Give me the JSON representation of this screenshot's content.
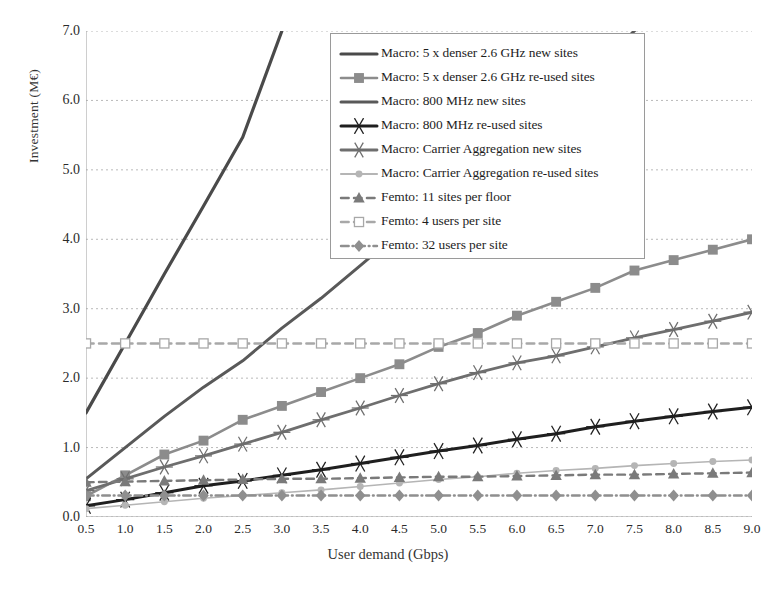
{
  "chart_data": {
    "type": "line",
    "title": "",
    "xlabel": "User demand (Gbps)",
    "ylabel": "Investment  (M€)",
    "xlim": [
      0.5,
      9.0
    ],
    "ylim": [
      0.0,
      7.0
    ],
    "grid": true,
    "legend_position": "top-center",
    "x": [
      0.5,
      1.0,
      1.5,
      2.0,
      2.5,
      3.0,
      3.5,
      4.0,
      4.5,
      5.0,
      5.5,
      6.0,
      6.5,
      7.0,
      7.5,
      8.0,
      8.5,
      9.0
    ],
    "xticks": [
      "0.5",
      "1.0",
      "1.5",
      "2.0",
      "2.5",
      "3.0",
      "3.5",
      "4.0",
      "4.5",
      "5.0",
      "5.5",
      "6.0",
      "6.5",
      "7.0",
      "7.5",
      "8.0",
      "8.5",
      "9.0"
    ],
    "yticks": [
      "0.0",
      "1.0",
      "2.0",
      "3.0",
      "4.0",
      "5.0",
      "6.0",
      "7.0"
    ],
    "series": [
      {
        "name": "Macro: 5 x denser 2.6 GHz new sites",
        "color": "#4a4a4a",
        "marker": "none",
        "dash": "solid",
        "width": 3.2,
        "values": [
          1.5,
          2.5,
          3.5,
          4.48,
          5.47,
          7.0,
          null,
          null,
          null,
          null,
          null,
          null,
          null,
          null,
          null,
          null,
          null,
          null
        ]
      },
      {
        "name": "Macro: 5 x denser 2.6 GHz re-used sites",
        "color": "#8c8c8c",
        "marker": "square",
        "dash": "solid",
        "width": 2.6,
        "values": [
          0.3,
          0.6,
          0.9,
          1.1,
          1.4,
          1.6,
          1.8,
          2.0,
          2.2,
          2.45,
          2.65,
          2.9,
          3.1,
          3.3,
          3.55,
          3.7,
          3.85,
          4.0
        ]
      },
      {
        "name": "Macro: 800 MHz new sites",
        "color": "#595959",
        "marker": "none",
        "dash": "solid",
        "width": 3.0,
        "values": [
          0.55,
          1.0,
          1.45,
          1.87,
          2.25,
          2.72,
          3.15,
          3.62,
          4.1,
          4.6,
          5.08,
          5.55,
          6.05,
          6.5,
          7.0,
          null,
          null,
          null
        ]
      },
      {
        "name": "Macro: 800 MHz re-used sites",
        "color": "#1f1f1f",
        "marker": "star",
        "dash": "solid",
        "width": 3.0,
        "values": [
          0.16,
          0.25,
          0.35,
          0.45,
          0.52,
          0.6,
          0.68,
          0.77,
          0.86,
          0.95,
          1.03,
          1.12,
          1.2,
          1.3,
          1.38,
          1.45,
          1.52,
          1.58
        ]
      },
      {
        "name": "Macro: Carrier Aggregation new sites",
        "color": "#6e6e6e",
        "marker": "star",
        "dash": "solid",
        "width": 2.8,
        "values": [
          0.38,
          0.55,
          0.72,
          0.88,
          1.05,
          1.22,
          1.4,
          1.57,
          1.75,
          1.92,
          2.08,
          2.22,
          2.32,
          2.45,
          2.58,
          2.7,
          2.82,
          2.95
        ]
      },
      {
        "name": "Macro: Carrier Aggregation re-used sites",
        "color": "#b5b5b5",
        "marker": "circle",
        "dash": "solid",
        "width": 1.6,
        "values": [
          0.12,
          0.17,
          0.22,
          0.27,
          0.31,
          0.35,
          0.39,
          0.44,
          0.49,
          0.54,
          0.58,
          0.63,
          0.67,
          0.7,
          0.74,
          0.77,
          0.8,
          0.82
        ]
      },
      {
        "name": "Femto: 11 sites per floor",
        "color": "#7a7a7a",
        "marker": "triangle",
        "dash": "dashed",
        "width": 2.4,
        "values": [
          0.5,
          0.51,
          0.52,
          0.53,
          0.54,
          0.55,
          0.55,
          0.56,
          0.57,
          0.58,
          0.58,
          0.59,
          0.6,
          0.61,
          0.61,
          0.62,
          0.63,
          0.64
        ]
      },
      {
        "name": "Femto: 4 users per site",
        "color": "#a8a8a8",
        "marker": "open-square",
        "dash": "dashed",
        "width": 2.4,
        "values": [
          2.5,
          2.5,
          2.5,
          2.5,
          2.5,
          2.5,
          2.5,
          2.5,
          2.5,
          2.5,
          2.5,
          2.5,
          2.5,
          2.5,
          2.5,
          2.5,
          2.5,
          2.5
        ]
      },
      {
        "name": "Femto: 32 users per site",
        "color": "#8f8f8f",
        "marker": "diamond",
        "dash": "dashdot",
        "width": 2.4,
        "values": [
          0.31,
          0.31,
          0.31,
          0.31,
          0.31,
          0.31,
          0.31,
          0.31,
          0.31,
          0.31,
          0.31,
          0.31,
          0.31,
          0.31,
          0.31,
          0.31,
          0.31,
          0.31
        ]
      }
    ]
  }
}
